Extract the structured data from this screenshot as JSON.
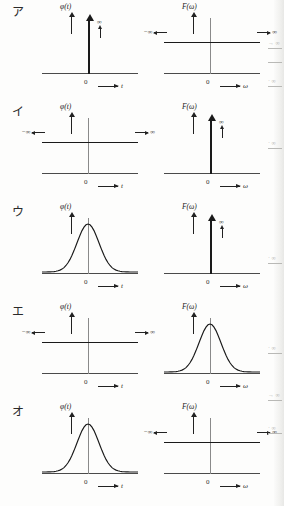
{
  "figure": {
    "axis_x_left": "t",
    "axis_x_right": "ω",
    "origin": "0",
    "fn_left": "φ(t)",
    "fn_right": "F(ω)",
    "infinity": "∞",
    "neg_infinity": "−∞",
    "pos_infinity": "∞"
  },
  "rows": [
    {
      "label": "ア",
      "left": {
        "kind": "impulse",
        "fn": "φ(t)",
        "axis": "t"
      },
      "right": {
        "kind": "constant",
        "fn": "F(ω)",
        "axis": "ω"
      }
    },
    {
      "label": "イ",
      "left": {
        "kind": "constant",
        "fn": "φ(t)",
        "axis": "t"
      },
      "right": {
        "kind": "impulse",
        "fn": "F(ω)",
        "axis": "ω"
      }
    },
    {
      "label": "ウ",
      "left": {
        "kind": "gaussian",
        "fn": "φ(t)",
        "axis": "t"
      },
      "right": {
        "kind": "impulse",
        "fn": "F(ω)",
        "axis": "ω"
      }
    },
    {
      "label": "エ",
      "left": {
        "kind": "constant",
        "fn": "φ(t)",
        "axis": "t"
      },
      "right": {
        "kind": "gaussian",
        "fn": "F(ω)",
        "axis": "ω"
      }
    },
    {
      "label": "オ",
      "left": {
        "kind": "gaussian",
        "fn": "φ(t)",
        "axis": "t"
      },
      "right": {
        "kind": "constant",
        "fn": "F(ω)",
        "axis": "ω"
      }
    }
  ],
  "bleed_marks": [
    {
      "top": 40,
      "text": "→ ∞"
    },
    {
      "top": 60,
      "text": ""
    },
    {
      "top": 78,
      "text": "· ∞"
    },
    {
      "top": 140,
      "text": "· ∞"
    },
    {
      "top": 255,
      "text": "· ∞"
    },
    {
      "top": 345,
      "text": "· ∞"
    },
    {
      "top": 392,
      "text": "→ ∞"
    },
    {
      "top": 425,
      "text": "· ∞"
    }
  ]
}
